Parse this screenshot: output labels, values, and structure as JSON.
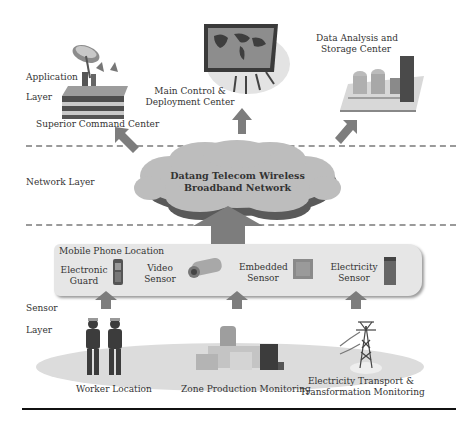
{
  "layers": {
    "application": {
      "line1": "Application",
      "line2": "Layer"
    },
    "network": {
      "label": "Network Layer"
    },
    "sensor": {
      "line1": "Sensor",
      "line2": "Layer"
    }
  },
  "application_nodes": {
    "superior_command": "Superior Command Center",
    "main_control": {
      "line1": "Main Control &",
      "line2": "Deployment Center"
    },
    "data_analysis": {
      "line1": "Data Analysis and",
      "line2": "Storage Center"
    }
  },
  "network": {
    "cloud": {
      "line1": "Datang Telecom Wireless",
      "line2": "Broadband Network"
    }
  },
  "sensor_bar": {
    "title": "Mobile Phone Location",
    "items": [
      {
        "line1": "Electronic",
        "line2": "Guard",
        "icon": "mobile-phone-icon"
      },
      {
        "line1": "Video",
        "line2": "Sensor",
        "icon": "video-camera-icon"
      },
      {
        "line1": "Embedded",
        "line2": "Sensor",
        "icon": "embedded-sensor-icon"
      },
      {
        "line1": "Electricity",
        "line2": "Sensor",
        "icon": "electricity-sensor-icon"
      }
    ]
  },
  "field": {
    "worker": "Worker Location",
    "zone": "Zone Production Monitoring",
    "transport": {
      "line1": "Electricity Transport &",
      "line2": "Transformation Monitoring"
    }
  },
  "colors": {
    "arrow": "#7d7d7d",
    "cloud": "#bdbdbd",
    "cloud_shadow": "#5a5a5a",
    "panel": "#e6e6e6",
    "ellipse": "#dcdcdc",
    "dash": "#9a9a9a"
  }
}
